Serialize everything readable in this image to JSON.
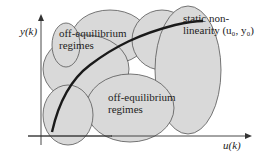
{
  "diagram": {
    "axes": {
      "y_label": "y(k)",
      "x_label": "u(k)"
    },
    "labels": {
      "regime_top_line1": "off-equilibrium",
      "regime_top_line2": "regimes",
      "regime_bottom_line1": "off-equilibrium",
      "regime_bottom_line2": "regimes",
      "curve_line1": "static non-",
      "curve_line2": "linearity (u₀, y₀)"
    },
    "colors": {
      "ellipse_fill": "#d9d9d9",
      "ellipse_stroke": "#555555",
      "curve": "#1a1a1a",
      "axis": "#333333"
    }
  }
}
